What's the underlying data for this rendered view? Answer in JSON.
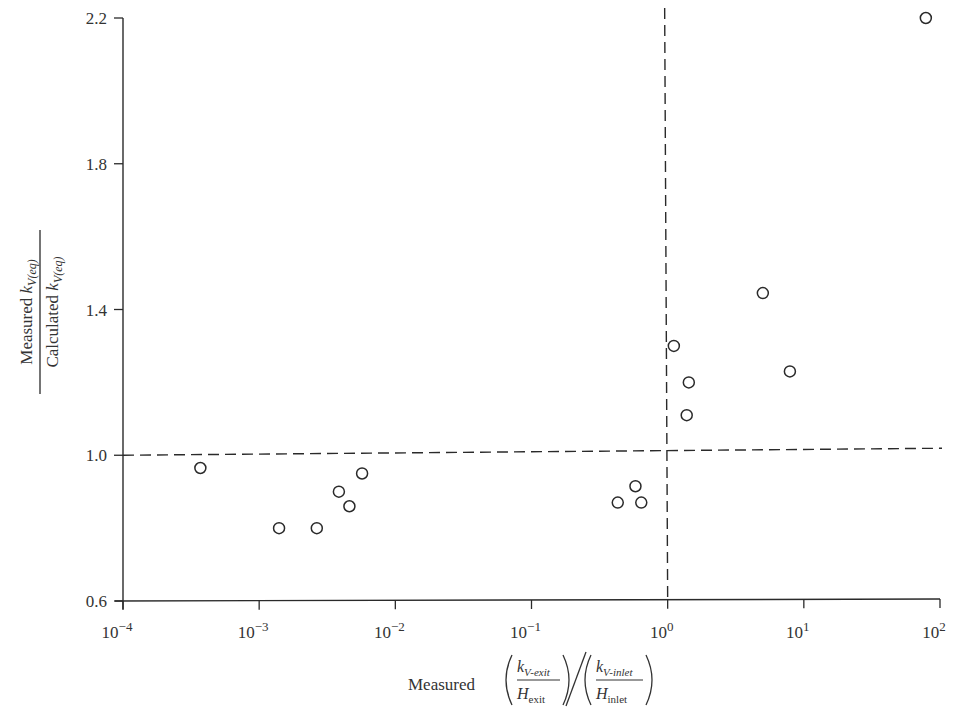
{
  "chart_data": {
    "type": "scatter",
    "title": "",
    "xlabel": "Measured (k_V-exit / H_exit) / (k_V-inlet / H_inlet)",
    "ylabel": "Measured k_V(eq) / Calculated k_V(eq)",
    "xscale": "log",
    "xlim": [
      0.0001,
      100
    ],
    "ylim": [
      0.6,
      2.2
    ],
    "x_ticks": [
      "10^-4",
      "10^-3",
      "10^-2",
      "10^-1",
      "10^0",
      "10^1",
      "10^2"
    ],
    "y_ticks": [
      "0.6",
      "1.0",
      "1.4",
      "1.8",
      "2.2"
    ],
    "grid": false,
    "legend": null,
    "reference_lines": [
      {
        "orientation": "horizontal",
        "y": 1.0,
        "style": "dashed"
      },
      {
        "orientation": "vertical",
        "x": 1.0,
        "style": "dashed"
      }
    ],
    "marker": "open-circle",
    "points": [
      {
        "x": 0.00037,
        "y": 0.965
      },
      {
        "x": 0.0014,
        "y": 0.8
      },
      {
        "x": 0.00265,
        "y": 0.8
      },
      {
        "x": 0.00385,
        "y": 0.9
      },
      {
        "x": 0.0046,
        "y": 0.86
      },
      {
        "x": 0.0057,
        "y": 0.95
      },
      {
        "x": 0.43,
        "y": 0.87
      },
      {
        "x": 0.58,
        "y": 0.915
      },
      {
        "x": 0.64,
        "y": 0.87
      },
      {
        "x": 1.11,
        "y": 1.3
      },
      {
        "x": 1.38,
        "y": 1.11
      },
      {
        "x": 1.43,
        "y": 1.2
      },
      {
        "x": 5.0,
        "y": 1.445
      },
      {
        "x": 7.9,
        "y": 1.23
      },
      {
        "x": 78.7,
        "y": 2.2
      }
    ]
  },
  "labels": {
    "y_numerator_prefix": "Measured ",
    "y_denominator_prefix": "Calculated ",
    "k": "k",
    "sub_eq": "V(eq)",
    "x_prefix": "Measured",
    "k_exit_sub": "V-exit",
    "H_exit_sub": "exit",
    "k_inlet_sub": "V-inlet",
    "H_inlet_sub": "inlet",
    "H": "H"
  },
  "colors": {
    "ink": "#2a2a2a",
    "background": "#ffffff"
  }
}
